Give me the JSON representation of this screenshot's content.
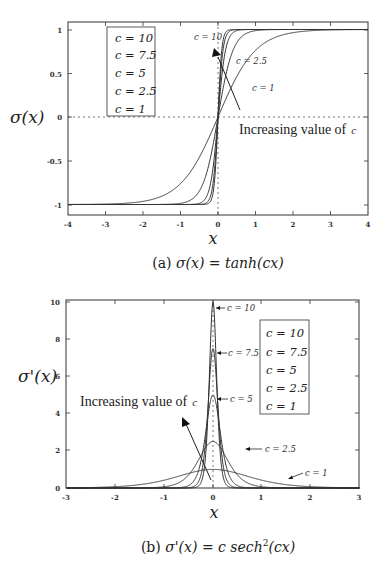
{
  "chart_data": [
    {
      "type": "line",
      "panel": "a",
      "title": "",
      "caption": "(a) σ(x) = tanh(cx)",
      "xlabel": "x",
      "ylabel": "σ(x)",
      "xlim": [
        -4,
        4
      ],
      "ylim": [
        -1,
        1
      ],
      "xticks": [
        -4,
        -3,
        -2,
        -1,
        0,
        1,
        2,
        3,
        4
      ],
      "yticks": [
        -1,
        -0.5,
        0,
        0.5,
        1
      ],
      "ytick_labels": [
        "-1",
        "-0.5",
        "0",
        "0.5",
        "1"
      ],
      "grid": false,
      "reference_lines": [
        "dotted horizontal line at y=0",
        "dotted vertical line at x=0"
      ],
      "legend": [
        "c = 10",
        "c = 7.5",
        "c = 5",
        "c = 2.5",
        "c = 1"
      ],
      "legend_position": "upper left",
      "series": [
        {
          "name": "c = 10",
          "c": 10
        },
        {
          "name": "c = 7.5",
          "c": 7.5
        },
        {
          "name": "c = 5",
          "c": 5
        },
        {
          "name": "c = 2.5",
          "c": 2.5
        },
        {
          "name": "c = 1",
          "c": 1
        }
      ],
      "sample_x": [
        -4,
        -3,
        -2,
        -1,
        -0.5,
        0,
        0.5,
        1,
        2,
        3,
        4
      ],
      "sample_values": {
        "c = 1": [
          -1.0,
          -0.995,
          -0.964,
          -0.762,
          -0.462,
          0,
          0.462,
          0.762,
          0.964,
          0.995,
          1.0
        ],
        "c = 2.5": [
          -1.0,
          -1.0,
          -1.0,
          -0.987,
          -0.849,
          0,
          0.849,
          0.987,
          1.0,
          1.0,
          1.0
        ],
        "c = 5": [
          -1.0,
          -1.0,
          -1.0,
          -1.0,
          -0.987,
          0,
          0.987,
          1.0,
          1.0,
          1.0,
          1.0
        ],
        "c = 7.5": [
          -1.0,
          -1.0,
          -1.0,
          -1.0,
          -0.999,
          0,
          0.999,
          1.0,
          1.0,
          1.0,
          1.0
        ],
        "c = 10": [
          -1.0,
          -1.0,
          -1.0,
          -1.0,
          -1.0,
          0,
          1.0,
          1.0,
          1.0,
          1.0,
          1.0
        ]
      },
      "annotations": [
        "c = 10",
        "c = 2.5",
        "c = 1",
        "Increasing value of c"
      ]
    },
    {
      "type": "line",
      "panel": "b",
      "title": "",
      "caption": "(b) σ'(x) = c sech²(cx)",
      "xlabel": "x",
      "ylabel": "σ'(x)",
      "xlim": [
        -3,
        3
      ],
      "ylim": [
        0,
        10
      ],
      "xticks": [
        -3,
        -2,
        -1,
        0,
        1,
        2,
        3
      ],
      "yticks": [
        0,
        2,
        4,
        6,
        8,
        10
      ],
      "ytick_labels": [
        "0",
        "2",
        "4",
        "6",
        "8",
        "10"
      ],
      "grid": false,
      "reference_lines": [
        "dotted vertical line at x=0"
      ],
      "legend": [
        "c = 10",
        "c = 7.5",
        "c = 5",
        "c = 2.5",
        "c = 1"
      ],
      "legend_position": "upper right",
      "series": [
        {
          "name": "c = 10",
          "c": 10,
          "peak": 10
        },
        {
          "name": "c = 7.5",
          "c": 7.5,
          "peak": 7.5
        },
        {
          "name": "c = 5",
          "c": 5,
          "peak": 5
        },
        {
          "name": "c = 2.5",
          "c": 2.5,
          "peak": 2.5
        },
        {
          "name": "c = 1",
          "c": 1,
          "peak": 1
        }
      ],
      "sample_x": [
        -3,
        -2,
        -1,
        -0.5,
        0,
        0.5,
        1,
        2,
        3
      ],
      "sample_values": {
        "c = 1": [
          0.01,
          0.07,
          0.42,
          0.79,
          1.0,
          0.79,
          0.42,
          0.07,
          0.01
        ],
        "c = 2.5": [
          0.0,
          0.0,
          0.07,
          0.7,
          2.5,
          0.7,
          0.07,
          0.0,
          0.0
        ],
        "c = 5": [
          0.0,
          0.0,
          0.0,
          0.13,
          5.0,
          0.13,
          0.0,
          0.0,
          0.0
        ],
        "c = 7.5": [
          0.0,
          0.0,
          0.0,
          0.02,
          7.5,
          0.02,
          0.0,
          0.0,
          0.0
        ],
        "c = 10": [
          0.0,
          0.0,
          0.0,
          0.0,
          10.0,
          0.0,
          0.0,
          0.0,
          0.0
        ]
      },
      "annotations": [
        "c = 10",
        "c = 7.5",
        "c = 5",
        "c = 2.5",
        "c = 1",
        "Increasing value of c"
      ]
    }
  ],
  "panel_a": {
    "ylabel": "σ(x)",
    "xlabel": "x",
    "caption_prefix": "(a) ",
    "caption_formula": "σ(x) = tanh(cx)",
    "yticks": [
      "1",
      "0.5",
      "0",
      "-0.5",
      "-1"
    ],
    "xticks": [
      "-4",
      "-3",
      "-2",
      "-1",
      "0",
      "1",
      "2",
      "3",
      "4"
    ],
    "legend": [
      "c = 10",
      "c = 7.5",
      "c = 5",
      "c = 2.5",
      "c = 1"
    ],
    "labels": {
      "c10": "c = 10",
      "c25": "c = 2.5",
      "c1": "c = 1"
    },
    "annotation": "Increasing value of",
    "annotation_var": "c"
  },
  "panel_b": {
    "ylabel": "σ'(x)",
    "xlabel": "x",
    "caption_prefix": "(b) ",
    "caption_formula": "σ'(x) = c sech",
    "caption_sup": "2",
    "caption_tail": "(cx)",
    "yticks": [
      "10",
      "8",
      "6",
      "4",
      "2",
      "0"
    ],
    "xticks": [
      "-3",
      "-2",
      "-1",
      "0",
      "1",
      "2",
      "3"
    ],
    "legend": [
      "c = 10",
      "c = 7.5",
      "c = 5",
      "c = 2.5",
      "c = 1"
    ],
    "labels": {
      "c10": "c = 10",
      "c75": "c = 7.5",
      "c5": "c = 5",
      "c25": "c = 2.5",
      "c1": "c = 1"
    },
    "annotation": "Increasing value of",
    "annotation_var": "c"
  }
}
